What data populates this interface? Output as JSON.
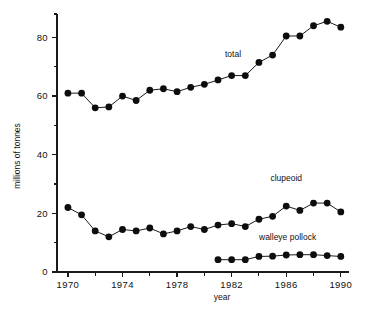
{
  "chart_data": {
    "type": "line",
    "title": "",
    "subtitle": "",
    "xlabel": "year",
    "ylabel": "millions of tonnes",
    "xlim": [
      1969.2,
      1990.6
    ],
    "ylim": [
      0,
      88
    ],
    "grid": false,
    "legend_position": "inline-annotations",
    "y_ticks_major": [
      0,
      20,
      40,
      60,
      80
    ],
    "y_ticks_minor": [
      10,
      30,
      50,
      70
    ],
    "y_tick_labels": [
      "0",
      "20",
      "40",
      "60",
      "80"
    ],
    "x_ticks_major": [
      1970,
      1974,
      1978,
      1982,
      1986,
      1990
    ],
    "x_ticks_minor": [
      1972,
      1976,
      1980,
      1984,
      1988
    ],
    "x_tick_labels": [
      "1970",
      "1974",
      "1978",
      "1982",
      "1986",
      "1990"
    ],
    "marker": "filled-circle",
    "marker_size": 3.4,
    "line_color": "#1a1a1a",
    "marker_color": "#0d0d0d",
    "series": [
      {
        "name": "total",
        "label": "total",
        "label_x": 1982.1,
        "label_y": 73.5,
        "x": [
          1970,
          1971,
          1972,
          1973,
          1974,
          1975,
          1976,
          1977,
          1978,
          1979,
          1980,
          1981,
          1982,
          1983,
          1984,
          1985,
          1986,
          1987,
          1988,
          1989,
          1990
        ],
        "values": [
          61.0,
          61.0,
          56.0,
          56.3,
          60.0,
          58.5,
          62.0,
          62.5,
          61.5,
          63.0,
          64.0,
          65.5,
          67.0,
          67.0,
          71.5,
          74.0,
          80.5,
          80.5,
          84.0,
          85.5,
          83.5
        ]
      },
      {
        "name": "clupeoid",
        "label": "clupeoid",
        "label_x": 1986.0,
        "label_y": 31.0,
        "x": [
          1970,
          1971,
          1972,
          1973,
          1974,
          1975,
          1976,
          1977,
          1978,
          1979,
          1980,
          1981,
          1982,
          1983,
          1984,
          1985,
          1986,
          1987,
          1988,
          1989,
          1990
        ],
        "values": [
          22.0,
          19.5,
          14.0,
          12.0,
          14.5,
          14.0,
          15.0,
          13.0,
          14.0,
          15.5,
          14.5,
          16.0,
          16.5,
          15.5,
          18.0,
          19.0,
          22.5,
          21.0,
          23.5,
          23.5,
          20.5
        ]
      },
      {
        "name": "walleye pollock",
        "label": "walleye pollock",
        "label_x": 1986.1,
        "label_y": 10.8,
        "x": [
          1981,
          1982,
          1983,
          1984,
          1985,
          1986,
          1987,
          1988,
          1989,
          1990
        ],
        "values": [
          4.2,
          4.2,
          4.2,
          5.3,
          5.4,
          5.8,
          5.9,
          5.9,
          5.6,
          5.3
        ]
      }
    ]
  }
}
